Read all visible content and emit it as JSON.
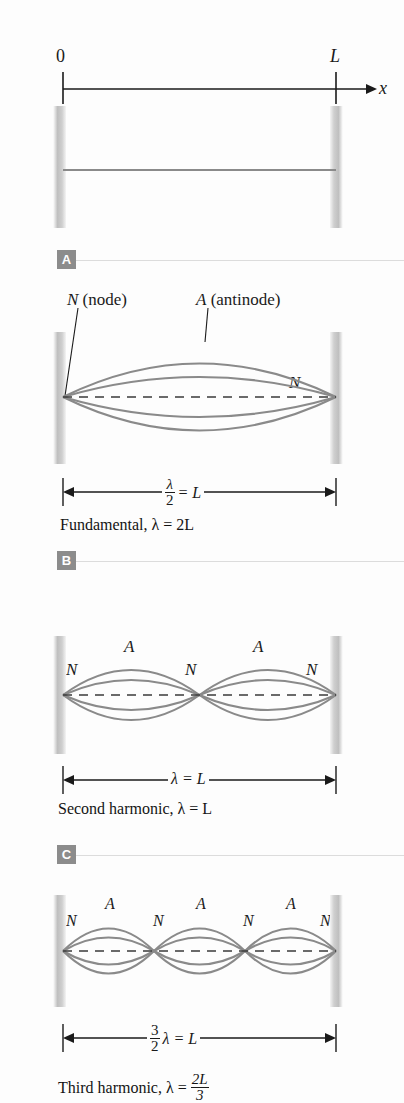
{
  "figure": {
    "background": "#fdfdfd",
    "curve_color": "#8a8a8a",
    "axis_color": "#1a1a1a",
    "badge_color": "#8c8c8c"
  },
  "axis": {
    "origin_label": "0",
    "length_label": "L",
    "arrow_label": "x"
  },
  "panels": [
    {
      "badge": "A",
      "state": "string at rest",
      "harmonic": 0,
      "loops": 0,
      "node_labels": [],
      "antinode_labels": [],
      "dimension": null,
      "caption": null
    },
    {
      "badge": "B",
      "state": "fundamental",
      "harmonic": 1,
      "loops": 1,
      "callout_node": "N (node)",
      "callout_antinode": "A (antinode)",
      "node_labels": [
        "N"
      ],
      "antinode_labels": [],
      "dimension": {
        "numerator": "λ",
        "denominator": "2",
        "equals": "= L"
      },
      "caption": "Fundamental, λ = 2L"
    },
    {
      "badge": "C",
      "state": "second harmonic",
      "harmonic": 2,
      "loops": 2,
      "node_labels": [
        "N",
        "N",
        "N"
      ],
      "antinode_labels": [
        "A",
        "A"
      ],
      "dimension": {
        "numerator": "",
        "denominator": "",
        "equals": "λ = L"
      },
      "caption": "Second harmonic, λ = L"
    },
    {
      "badge": "D",
      "state": "third harmonic",
      "harmonic": 3,
      "loops": 3,
      "node_labels": [
        "N",
        "N",
        "N",
        "N"
      ],
      "antinode_labels": [
        "A",
        "A",
        "A"
      ],
      "dimension": {
        "numerator": "3",
        "denominator": "2",
        "equals": "λ = L"
      },
      "caption_prefix": "Third harmonic, λ =",
      "caption_num": "2L",
      "caption_den": "3"
    }
  ]
}
